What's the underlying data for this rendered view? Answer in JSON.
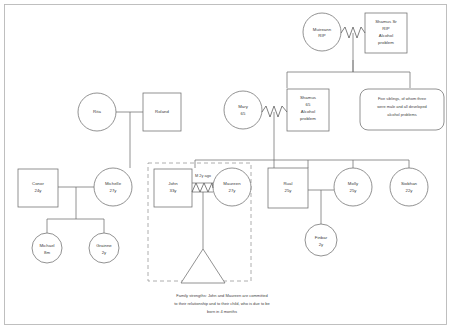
{
  "diagram": {
    "caption": {
      "line1": "Family strengths: John and Maureen are committed",
      "line2": "to their relationship and to their child, who is due to be",
      "line3": "born in 4 months"
    },
    "colors": {
      "stroke": "#6d6d6d",
      "text": "#3a3a3a",
      "dashed": "#9a9a9a",
      "frame": "#b9b9b9",
      "background": "#ffffff"
    },
    "people": {
      "muireann": {
        "name": "Muireann",
        "line2": "RIP",
        "shape": "circle"
      },
      "shamus_sr": {
        "name": "Shamus Sr",
        "line2": "RIP",
        "line3": "Alcohol",
        "line4": "problem",
        "shape": "square"
      },
      "siblings_note": {
        "line1": "Five siblings, of whom three",
        "line2": "were male and all developed",
        "line3": "alcohol problems",
        "shape": "rounded-rect"
      },
      "mary": {
        "name": "Mary",
        "line2": "65",
        "shape": "circle"
      },
      "shamus": {
        "name": "Shamus",
        "line2": "65",
        "line3": "Alcohol",
        "line4": "problem",
        "shape": "square"
      },
      "rita": {
        "name": "Rita",
        "shape": "circle"
      },
      "roland": {
        "name": "Roland",
        "shape": "square"
      },
      "conor": {
        "name": "Conor",
        "line2": "24y",
        "shape": "square"
      },
      "michelle": {
        "name": "Michelle",
        "line2": "27y",
        "shape": "circle"
      },
      "john": {
        "name": "John",
        "line2": "33y",
        "shape": "square"
      },
      "maureen": {
        "name": "Maureen",
        "line2": "27y",
        "shape": "circle"
      },
      "rual": {
        "name": "Rual",
        "line2": "25y",
        "shape": "square"
      },
      "molly": {
        "name": "Molly",
        "line2": "25y",
        "shape": "circle"
      },
      "siobhan": {
        "name": "Siobhan",
        "line2": "22y",
        "shape": "circle"
      },
      "michael": {
        "name": "Michael",
        "line2": "8m",
        "shape": "circle"
      },
      "grainne": {
        "name": "Grainne",
        "line2": "2y",
        "shape": "circle"
      },
      "finbar": {
        "name": "Finbar",
        "line2": "2y",
        "shape": "circle"
      },
      "unborn": {
        "name": "Expected child",
        "shape": "triangle"
      }
    },
    "relationships": {
      "marriage_john_maureen": "M  2y ago"
    }
  }
}
